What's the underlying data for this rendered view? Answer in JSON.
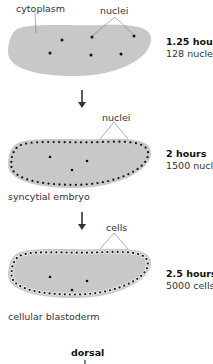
{
  "stages": [
    {
      "time": "1.25 hours",
      "count": "128 nuclei",
      "labels": {
        "left": "cytoplasm",
        "top": "nuclei"
      }
    },
    {
      "time": "2 hours",
      "count": "1500 nuclei",
      "labels": {
        "top": "nuclei",
        "bottom": "syncytial embryo"
      }
    },
    {
      "time": "2.5 hours",
      "count": "5000 cells",
      "labels": {
        "top": "cells",
        "bottom": "cellular blastoderm"
      }
    }
  ],
  "axis_label": "dorsal",
  "colors": {
    "embryo_fill": "#c8c8c8",
    "cell_fill": "#f0f0f0",
    "nucleus": "#111111"
  }
}
